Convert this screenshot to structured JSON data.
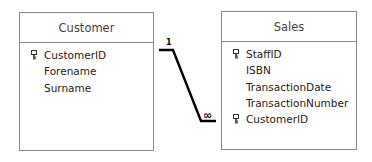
{
  "tables": [
    {
      "name": "Customer",
      "fields": [
        {
          "name": "CustomerID",
          "is_key": true
        },
        {
          "name": "Forename",
          "is_key": false
        },
        {
          "name": "Surname",
          "is_key": false
        }
      ]
    },
    {
      "name": "Sales",
      "fields": [
        {
          "name": "StaffID",
          "is_key": true
        },
        {
          "name": "ISBN",
          "is_key": false
        },
        {
          "name": "TransactionDate",
          "is_key": false
        },
        {
          "name": "TransactionNumber",
          "is_key": false
        },
        {
          "name": "CustomerID",
          "is_key": true
        }
      ]
    }
  ],
  "relationship": {
    "from": "Customer.CustomerID",
    "to": "Sales.CustomerID",
    "one_label": "1",
    "many_label": "∞"
  }
}
